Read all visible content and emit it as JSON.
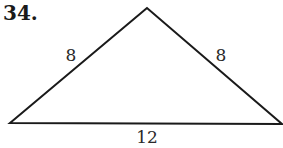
{
  "problem": {
    "number": "34."
  },
  "triangle": {
    "type": "isosceles",
    "vertices": {
      "apex": [
        147,
        8
      ],
      "bottom_left": [
        10,
        123
      ],
      "bottom_right": [
        282,
        124
      ]
    },
    "sides": {
      "left": "8",
      "right": "8",
      "base": "12"
    },
    "stroke_color": "#1a1a1a",
    "stroke_width": 2
  }
}
